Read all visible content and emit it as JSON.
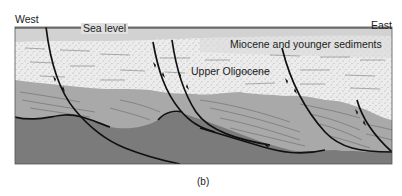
{
  "figure": {
    "labels": {
      "west": "West",
      "east": "East",
      "sea_level": "Sea level",
      "miocene": "Miocene and younger sediments",
      "upper_oligocene": "Upper Oligocene",
      "caption": "(b)"
    },
    "colors": {
      "water_band": "#d2d2d2",
      "sediment_light": "#ececec",
      "oligocene_gray": "#a9a9a9",
      "basement_dark": "#7b7b7b",
      "fault_line": "#111111"
    },
    "fault_count": 4
  }
}
